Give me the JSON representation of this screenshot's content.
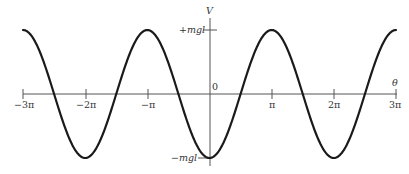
{
  "chart_data": {
    "type": "line",
    "title": "",
    "function": "V = -mgl cos(theta)",
    "xlabel": "θ",
    "ylabel": "V",
    "xlim": [
      -9.42478,
      9.42478
    ],
    "ylim": [
      -1,
      1
    ],
    "grid": false,
    "legend": null,
    "x_ticks": [
      {
        "value": -9.42478,
        "label": "−3π"
      },
      {
        "value": -6.28319,
        "label": "−2π"
      },
      {
        "value": -3.14159,
        "label": "−π"
      },
      {
        "value": 0,
        "label": "0"
      },
      {
        "value": 3.14159,
        "label": "π"
      },
      {
        "value": 6.28319,
        "label": "2π"
      },
      {
        "value": 9.42478,
        "label": "3π"
      }
    ],
    "y_ticks": [
      {
        "value": 1,
        "label": "+mgl"
      },
      {
        "value": -1,
        "label": "−mgl"
      }
    ],
    "series": [
      {
        "name": "V(θ)",
        "x": [
          -9.42478,
          -7.85398,
          -6.28319,
          -4.71239,
          -3.14159,
          -1.5708,
          0,
          1.5708,
          3.14159,
          4.71239,
          6.28319,
          7.85398,
          9.42478
        ],
        "values": [
          1,
          0,
          -1,
          0,
          1,
          0,
          -1,
          0,
          1,
          0,
          -1,
          0,
          1
        ]
      }
    ]
  },
  "labels": {
    "y_axis": "V",
    "x_axis": "θ",
    "origin": "0",
    "y_max": "+mgl",
    "y_min": "−mgl",
    "x_ticks": [
      "−3π",
      "−2π",
      "−π",
      "π",
      "2π",
      "3π"
    ]
  },
  "colors": {
    "curve": "#1a1a1a",
    "axis": "#555555",
    "text": "#333333"
  }
}
